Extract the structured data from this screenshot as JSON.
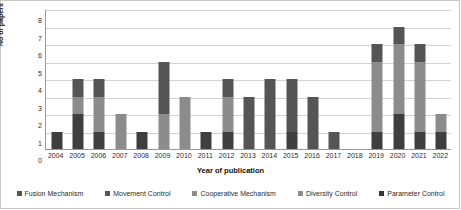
{
  "chart_data": {
    "type": "bar",
    "stacked": true,
    "title": "",
    "xlabel": "Year of publication",
    "ylabel": "No of papers",
    "ylim": [
      0,
      8
    ],
    "ytick_step": 1,
    "yticks": [
      8,
      7,
      6,
      5,
      4,
      3,
      2,
      1,
      0
    ],
    "grid": true,
    "legend_position": "bottom",
    "categories": [
      "2004",
      "2005",
      "2006",
      "2007",
      "2008",
      "2009",
      "2010",
      "2011",
      "2012",
      "2013",
      "2014",
      "2015",
      "2016",
      "2017",
      "2018",
      "2019",
      "2020",
      "2021",
      "2022"
    ],
    "series": [
      {
        "name": "Fusion Mechanism",
        "color": "#3f3f3f",
        "values": [
          0,
          0,
          0,
          0,
          0,
          0,
          0,
          0,
          0,
          0,
          0,
          0,
          0,
          0,
          0,
          0,
          0,
          0,
          0
        ]
      },
      {
        "name": "Movement Control",
        "color": "#595959",
        "values": [
          1,
          0,
          0,
          0,
          1,
          0,
          0,
          1,
          0,
          3,
          4,
          3,
          3,
          1,
          0,
          1,
          0,
          1,
          0
        ]
      },
      {
        "name": "Cooperative Mechanism",
        "color": "#8c8c8c",
        "values": [
          0,
          1,
          2,
          2,
          0,
          2,
          3,
          0,
          2,
          0,
          0,
          0,
          0,
          0,
          0,
          4,
          4,
          4,
          1
        ]
      },
      {
        "name": "Diversity Control",
        "color": "#7a7a7a",
        "values": [
          0,
          1,
          0,
          0,
          0,
          0,
          0,
          0,
          0,
          0,
          0,
          0,
          0,
          0,
          0,
          0,
          0,
          0,
          0
        ]
      },
      {
        "name": "Parameter Control",
        "color": "#3f3f3f",
        "values": [
          0,
          2,
          2,
          0,
          0,
          3,
          0,
          0,
          2,
          0,
          0,
          1,
          0,
          0,
          0,
          1,
          3,
          1,
          1
        ]
      }
    ],
    "totals": [
      1,
      4,
      4,
      2,
      1,
      5,
      3,
      1,
      4,
      3,
      4,
      4,
      3,
      1,
      0,
      6,
      7,
      6,
      2
    ],
    "stacks": [
      {
        "year": "2004",
        "segments": [
          {
            "value": 1,
            "color": "#3f3f3f"
          }
        ]
      },
      {
        "year": "2005",
        "segments": [
          {
            "value": 2,
            "color": "#3f3f3f"
          },
          {
            "value": 1,
            "color": "#8c8c8c"
          },
          {
            "value": 1,
            "color": "#555555"
          }
        ]
      },
      {
        "year": "2006",
        "segments": [
          {
            "value": 1,
            "color": "#3f3f3f"
          },
          {
            "value": 2,
            "color": "#8c8c8c"
          },
          {
            "value": 1,
            "color": "#555555"
          }
        ]
      },
      {
        "year": "2007",
        "segments": [
          {
            "value": 2,
            "color": "#8c8c8c"
          }
        ]
      },
      {
        "year": "2008",
        "segments": [
          {
            "value": 1,
            "color": "#3f3f3f"
          }
        ]
      },
      {
        "year": "2009",
        "segments": [
          {
            "value": 2,
            "color": "#8c8c8c"
          },
          {
            "value": 3,
            "color": "#555555"
          }
        ]
      },
      {
        "year": "2010",
        "segments": [
          {
            "value": 3,
            "color": "#8c8c8c"
          }
        ]
      },
      {
        "year": "2011",
        "segments": [
          {
            "value": 1,
            "color": "#3f3f3f"
          }
        ]
      },
      {
        "year": "2012",
        "segments": [
          {
            "value": 1,
            "color": "#3f3f3f"
          },
          {
            "value": 2,
            "color": "#8c8c8c"
          },
          {
            "value": 1,
            "color": "#555555"
          }
        ]
      },
      {
        "year": "2013",
        "segments": [
          {
            "value": 3,
            "color": "#555555"
          }
        ]
      },
      {
        "year": "2014",
        "segments": [
          {
            "value": 4,
            "color": "#555555"
          }
        ]
      },
      {
        "year": "2015",
        "segments": [
          {
            "value": 1,
            "color": "#3f3f3f"
          },
          {
            "value": 3,
            "color": "#555555"
          }
        ]
      },
      {
        "year": "2016",
        "segments": [
          {
            "value": 3,
            "color": "#555555"
          }
        ]
      },
      {
        "year": "2017",
        "segments": [
          {
            "value": 1,
            "color": "#555555"
          }
        ]
      },
      {
        "year": "2018",
        "segments": []
      },
      {
        "year": "2019",
        "segments": [
          {
            "value": 1,
            "color": "#3f3f3f"
          },
          {
            "value": 4,
            "color": "#8c8c8c"
          },
          {
            "value": 1,
            "color": "#555555"
          }
        ]
      },
      {
        "year": "2020",
        "segments": [
          {
            "value": 2,
            "color": "#3f3f3f"
          },
          {
            "value": 4,
            "color": "#8c8c8c"
          },
          {
            "value": 1,
            "color": "#555555"
          }
        ]
      },
      {
        "year": "2021",
        "segments": [
          {
            "value": 1,
            "color": "#3f3f3f"
          },
          {
            "value": 4,
            "color": "#8c8c8c"
          },
          {
            "value": 1,
            "color": "#555555"
          }
        ]
      },
      {
        "year": "2022",
        "segments": [
          {
            "value": 1,
            "color": "#3f3f3f"
          },
          {
            "value": 1,
            "color": "#8c8c8c"
          }
        ]
      }
    ],
    "legend": [
      {
        "label": "Fusion Mechanism",
        "color": "#555555"
      },
      {
        "label": "Movement Control",
        "color": "#555555"
      },
      {
        "label": "Cooperative Mechanism",
        "color": "#8c8c8c"
      },
      {
        "label": "Diversity Control",
        "color": "#8c8c8c"
      },
      {
        "label": "Parameter Control",
        "color": "#333333"
      }
    ]
  }
}
